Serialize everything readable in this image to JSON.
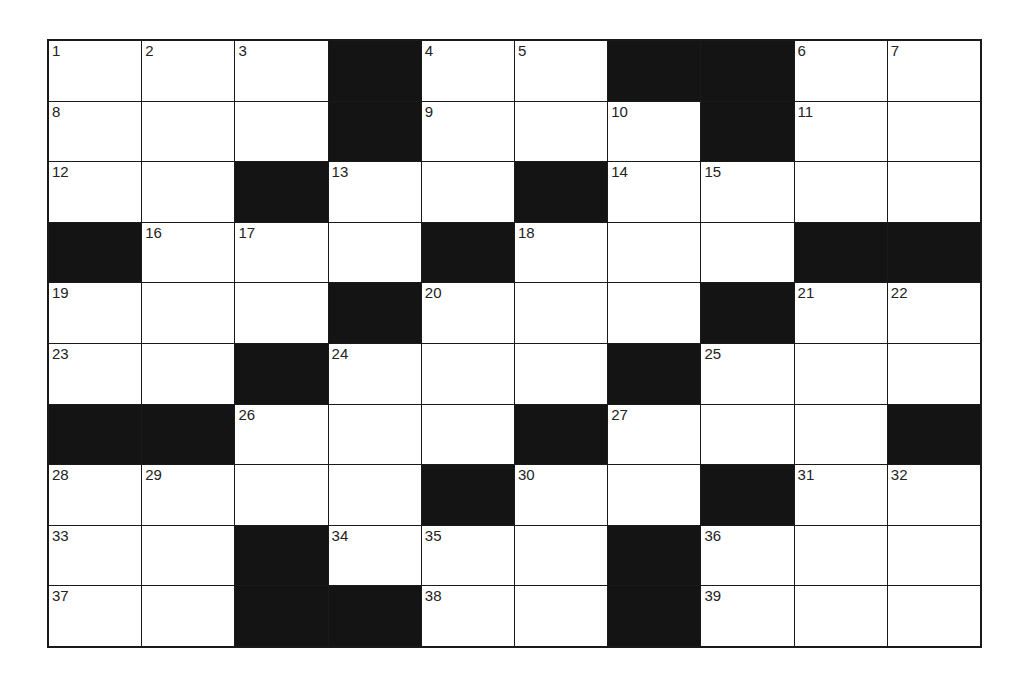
{
  "puzzle": {
    "rows": 10,
    "cols": 10,
    "block_color": "#141414",
    "grid": [
      [
        "1",
        "2",
        "3",
        "#",
        "4",
        "5",
        "#",
        "#",
        "6",
        "7"
      ],
      [
        "8",
        "",
        "",
        "#",
        "9",
        "",
        "10",
        "#",
        "11",
        ""
      ],
      [
        "12",
        "",
        "#",
        "13",
        "",
        "#",
        "14",
        "15",
        "",
        ""
      ],
      [
        "#",
        "16",
        "17",
        "",
        "#",
        "18",
        "",
        "",
        "#",
        "#"
      ],
      [
        "19",
        "",
        "",
        "#",
        "20",
        "",
        "",
        "#",
        "21",
        "22"
      ],
      [
        "23",
        "",
        "#",
        "24",
        "",
        "",
        "#",
        "25",
        "",
        ""
      ],
      [
        "#",
        "#",
        "26",
        "",
        "",
        "#",
        "27",
        "",
        "",
        "#"
      ],
      [
        "28",
        "29",
        "",
        "",
        "#",
        "30",
        "",
        "#",
        "31",
        "32"
      ],
      [
        "33",
        "",
        "#",
        "34",
        "35",
        "",
        "#",
        "36",
        "",
        ""
      ],
      [
        "37",
        "",
        "#",
        "#",
        "38",
        "",
        "#",
        "39",
        "",
        ""
      ]
    ]
  }
}
